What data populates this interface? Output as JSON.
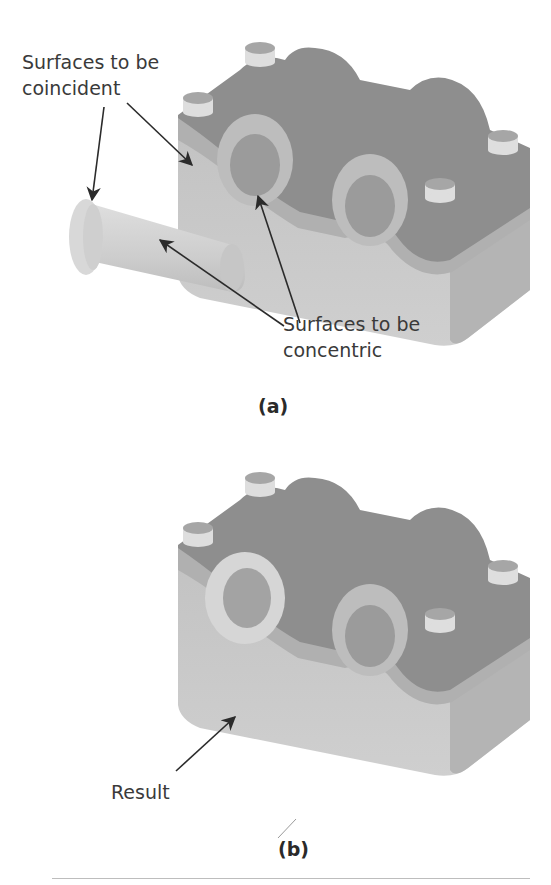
{
  "figure": {
    "panel_a": {
      "caption": "(a)",
      "labels": {
        "coincident_line1": "Surfaces to be",
        "coincident_line2": "coincident",
        "concentric_line1": "Surfaces to be",
        "concentric_line2": "concentric"
      },
      "parts": [
        "bushing-sleeve",
        "pillow-block-housing"
      ]
    },
    "panel_b": {
      "caption": "(b)",
      "labels": {
        "result": "Result"
      },
      "parts": [
        "pillow-block-housing-with-inserted-bushing"
      ]
    },
    "colors": {
      "housing_top": "#8f8f8f",
      "housing_side": "#b9b9b9",
      "housing_front": "#c4c4c4",
      "bore": "#9a9a9a",
      "pin_top": "#a8a8a8",
      "pin_side": "#dcdcdc",
      "bushing": "#d2d2d2",
      "arrow": "#2b2b2b",
      "text": "#3a3a3a"
    }
  }
}
